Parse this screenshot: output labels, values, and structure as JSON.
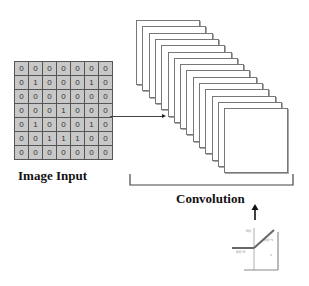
{
  "input": {
    "label": "Image Input",
    "matrix": [
      [
        "0",
        "0",
        "0",
        "0",
        "0",
        "0",
        "0"
      ],
      [
        "0",
        "1",
        "0",
        "0",
        "0",
        "1",
        "0"
      ],
      [
        "0",
        "0",
        "0",
        "0",
        "0",
        "0",
        "0"
      ],
      [
        "0",
        "0",
        "0",
        "1",
        "0",
        "0",
        "0"
      ],
      [
        "0",
        "1",
        "0",
        "0",
        "0",
        "1",
        "0"
      ],
      [
        "0",
        "0",
        "1",
        "1",
        "1",
        "0",
        "0"
      ],
      [
        "0",
        "0",
        "0",
        "0",
        "0",
        "0",
        "0"
      ]
    ]
  },
  "convolution": {
    "label": "Convolution",
    "feature_map_count": 15
  },
  "activation": {
    "type": "ReLU graph",
    "labels": [
      "f(x)",
      "f(x)=x",
      "f(x)=0",
      "x"
    ]
  },
  "colors": {
    "cell_fill": "#c8c8c8",
    "grid_line": "#555555",
    "frame_border": "#777777",
    "text": "#111111"
  }
}
